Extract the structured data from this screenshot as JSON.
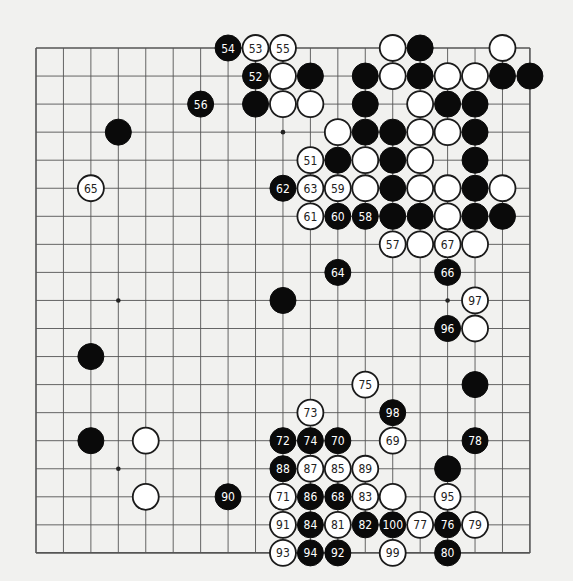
{
  "board": {
    "size": 19,
    "origin_x": 36,
    "origin_y": 48,
    "spacing_x": 27.44,
    "spacing_y": 28.05,
    "stone_radius": 13,
    "colors": {
      "background": "#f1f1ef",
      "line": "#555555",
      "black": "#0a0a0a",
      "white": "#ffffff",
      "black_label": "#ffffff",
      "white_label": "#222222"
    },
    "star_points": [
      [
        3,
        3
      ],
      [
        9,
        3
      ],
      [
        15,
        3
      ],
      [
        3,
        9
      ],
      [
        9,
        9
      ],
      [
        15,
        9
      ],
      [
        3,
        15
      ],
      [
        9,
        15
      ],
      [
        15,
        15
      ]
    ],
    "stones": [
      {
        "col": 7,
        "row": 0,
        "color": "black",
        "label": "54"
      },
      {
        "col": 8,
        "row": 0,
        "color": "white",
        "label": "53"
      },
      {
        "col": 9,
        "row": 0,
        "color": "white",
        "label": "55"
      },
      {
        "col": 13,
        "row": 0,
        "color": "white",
        "label": ""
      },
      {
        "col": 14,
        "row": 0,
        "color": "black",
        "label": ""
      },
      {
        "col": 17,
        "row": 0,
        "color": "white",
        "label": ""
      },
      {
        "col": 8,
        "row": 1,
        "color": "black",
        "label": "52"
      },
      {
        "col": 9,
        "row": 1,
        "color": "white",
        "label": ""
      },
      {
        "col": 10,
        "row": 1,
        "color": "black",
        "label": ""
      },
      {
        "col": 12,
        "row": 1,
        "color": "black",
        "label": ""
      },
      {
        "col": 13,
        "row": 1,
        "color": "white",
        "label": ""
      },
      {
        "col": 14,
        "row": 1,
        "color": "black",
        "label": ""
      },
      {
        "col": 15,
        "row": 1,
        "color": "white",
        "label": ""
      },
      {
        "col": 16,
        "row": 1,
        "color": "white",
        "label": ""
      },
      {
        "col": 17,
        "row": 1,
        "color": "black",
        "label": ""
      },
      {
        "col": 18,
        "row": 1,
        "color": "black",
        "label": ""
      },
      {
        "col": 6,
        "row": 2,
        "color": "black",
        "label": "56"
      },
      {
        "col": 8,
        "row": 2,
        "color": "black",
        "label": ""
      },
      {
        "col": 9,
        "row": 2,
        "color": "white",
        "label": ""
      },
      {
        "col": 10,
        "row": 2,
        "color": "white",
        "label": ""
      },
      {
        "col": 12,
        "row": 2,
        "color": "black",
        "label": ""
      },
      {
        "col": 14,
        "row": 2,
        "color": "white",
        "label": ""
      },
      {
        "col": 15,
        "row": 2,
        "color": "black",
        "label": ""
      },
      {
        "col": 16,
        "row": 2,
        "color": "black",
        "label": ""
      },
      {
        "col": 3,
        "row": 3,
        "color": "black",
        "label": ""
      },
      {
        "col": 11,
        "row": 3,
        "color": "white",
        "label": ""
      },
      {
        "col": 12,
        "row": 3,
        "color": "black",
        "label": ""
      },
      {
        "col": 13,
        "row": 3,
        "color": "black",
        "label": ""
      },
      {
        "col": 14,
        "row": 3,
        "color": "white",
        "label": ""
      },
      {
        "col": 15,
        "row": 3,
        "color": "white",
        "label": ""
      },
      {
        "col": 16,
        "row": 3,
        "color": "black",
        "label": ""
      },
      {
        "col": 10,
        "row": 4,
        "color": "white",
        "label": "51"
      },
      {
        "col": 11,
        "row": 4,
        "color": "black",
        "label": ""
      },
      {
        "col": 12,
        "row": 4,
        "color": "white",
        "label": ""
      },
      {
        "col": 13,
        "row": 4,
        "color": "black",
        "label": ""
      },
      {
        "col": 14,
        "row": 4,
        "color": "white",
        "label": ""
      },
      {
        "col": 16,
        "row": 4,
        "color": "black",
        "label": ""
      },
      {
        "col": 2,
        "row": 5,
        "color": "white",
        "label": "65"
      },
      {
        "col": 9,
        "row": 5,
        "color": "black",
        "label": "62"
      },
      {
        "col": 10,
        "row": 5,
        "color": "white",
        "label": "63"
      },
      {
        "col": 11,
        "row": 5,
        "color": "white",
        "label": "59"
      },
      {
        "col": 12,
        "row": 5,
        "color": "white",
        "label": ""
      },
      {
        "col": 13,
        "row": 5,
        "color": "black",
        "label": ""
      },
      {
        "col": 14,
        "row": 5,
        "color": "white",
        "label": ""
      },
      {
        "col": 15,
        "row": 5,
        "color": "white",
        "label": ""
      },
      {
        "col": 16,
        "row": 5,
        "color": "black",
        "label": ""
      },
      {
        "col": 17,
        "row": 5,
        "color": "white",
        "label": ""
      },
      {
        "col": 10,
        "row": 6,
        "color": "white",
        "label": "61"
      },
      {
        "col": 11,
        "row": 6,
        "color": "black",
        "label": "60"
      },
      {
        "col": 12,
        "row": 6,
        "color": "black",
        "label": "58"
      },
      {
        "col": 13,
        "row": 6,
        "color": "black",
        "label": ""
      },
      {
        "col": 14,
        "row": 6,
        "color": "black",
        "label": ""
      },
      {
        "col": 15,
        "row": 6,
        "color": "white",
        "label": ""
      },
      {
        "col": 16,
        "row": 6,
        "color": "black",
        "label": ""
      },
      {
        "col": 17,
        "row": 6,
        "color": "black",
        "label": ""
      },
      {
        "col": 13,
        "row": 7,
        "color": "white",
        "label": "57"
      },
      {
        "col": 14,
        "row": 7,
        "color": "white",
        "label": ""
      },
      {
        "col": 15,
        "row": 7,
        "color": "white",
        "label": "67"
      },
      {
        "col": 16,
        "row": 7,
        "color": "white",
        "label": ""
      },
      {
        "col": 11,
        "row": 8,
        "color": "black",
        "label": "64"
      },
      {
        "col": 15,
        "row": 8,
        "color": "black",
        "label": "66"
      },
      {
        "col": 9,
        "row": 9,
        "color": "black",
        "label": ""
      },
      {
        "col": 16,
        "row": 9,
        "color": "white",
        "label": "97"
      },
      {
        "col": 15,
        "row": 10,
        "color": "black",
        "label": "96"
      },
      {
        "col": 16,
        "row": 10,
        "color": "white",
        "label": ""
      },
      {
        "col": 2,
        "row": 11,
        "color": "black",
        "label": ""
      },
      {
        "col": 12,
        "row": 12,
        "color": "white",
        "label": "75"
      },
      {
        "col": 16,
        "row": 12,
        "color": "black",
        "label": ""
      },
      {
        "col": 10,
        "row": 13,
        "color": "white",
        "label": "73"
      },
      {
        "col": 13,
        "row": 13,
        "color": "black",
        "label": "98"
      },
      {
        "col": 2,
        "row": 14,
        "color": "black",
        "label": ""
      },
      {
        "col": 4,
        "row": 14,
        "color": "white",
        "label": ""
      },
      {
        "col": 9,
        "row": 14,
        "color": "black",
        "label": "72"
      },
      {
        "col": 10,
        "row": 14,
        "color": "black",
        "label": "74"
      },
      {
        "col": 11,
        "row": 14,
        "color": "black",
        "label": "70"
      },
      {
        "col": 13,
        "row": 14,
        "color": "white",
        "label": "69"
      },
      {
        "col": 16,
        "row": 14,
        "color": "black",
        "label": "78"
      },
      {
        "col": 9,
        "row": 15,
        "color": "black",
        "label": "88"
      },
      {
        "col": 10,
        "row": 15,
        "color": "white",
        "label": "87"
      },
      {
        "col": 11,
        "row": 15,
        "color": "white",
        "label": "85"
      },
      {
        "col": 12,
        "row": 15,
        "color": "white",
        "label": "89"
      },
      {
        "col": 15,
        "row": 15,
        "color": "black",
        "label": ""
      },
      {
        "col": 4,
        "row": 16,
        "color": "white",
        "label": ""
      },
      {
        "col": 7,
        "row": 16,
        "color": "black",
        "label": "90"
      },
      {
        "col": 9,
        "row": 16,
        "color": "white",
        "label": "71"
      },
      {
        "col": 10,
        "row": 16,
        "color": "black",
        "label": "86"
      },
      {
        "col": 11,
        "row": 16,
        "color": "black",
        "label": "68"
      },
      {
        "col": 12,
        "row": 16,
        "color": "white",
        "label": "83"
      },
      {
        "col": 13,
        "row": 16,
        "color": "white",
        "label": ""
      },
      {
        "col": 15,
        "row": 16,
        "color": "white",
        "label": "95"
      },
      {
        "col": 9,
        "row": 17,
        "color": "white",
        "label": "91"
      },
      {
        "col": 10,
        "row": 17,
        "color": "black",
        "label": "84"
      },
      {
        "col": 11,
        "row": 17,
        "color": "white",
        "label": "81"
      },
      {
        "col": 12,
        "row": 17,
        "color": "black",
        "label": "82"
      },
      {
        "col": 13,
        "row": 17,
        "color": "black",
        "label": "100"
      },
      {
        "col": 14,
        "row": 17,
        "color": "white",
        "label": "77"
      },
      {
        "col": 15,
        "row": 17,
        "color": "black",
        "label": "76"
      },
      {
        "col": 16,
        "row": 17,
        "color": "white",
        "label": "79"
      },
      {
        "col": 9,
        "row": 18,
        "color": "white",
        "label": "93"
      },
      {
        "col": 10,
        "row": 18,
        "color": "black",
        "label": "94"
      },
      {
        "col": 11,
        "row": 18,
        "color": "black",
        "label": "92"
      },
      {
        "col": 13,
        "row": 18,
        "color": "white",
        "label": "99"
      },
      {
        "col": 15,
        "row": 18,
        "color": "black",
        "label": "80"
      }
    ]
  }
}
